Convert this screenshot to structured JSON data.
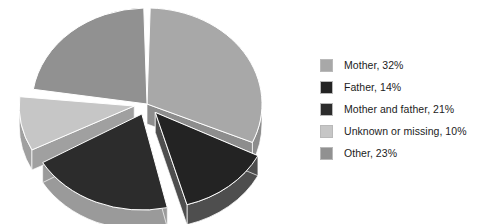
{
  "chart_data": {
    "type": "pie",
    "title": "",
    "subtitle": "",
    "xlabel": "",
    "ylabel": "",
    "style": "3d-exploded",
    "legend_position": "right",
    "grid": false,
    "categories": [
      "Mother",
      "Father",
      "Mother and father",
      "Unknown or missing",
      "Other"
    ],
    "values": [
      32,
      14,
      21,
      10,
      23
    ],
    "value_unit": "%",
    "slices": [
      {
        "label": "Mother",
        "value": 32,
        "legend_text": "Mother, 32%",
        "color": "#a8a8a8",
        "side_color": "#8d8d8d",
        "exploded": false
      },
      {
        "label": "Father",
        "value": 14,
        "legend_text": "Father, 14%",
        "color": "#232323",
        "side_color": "#4e4e4e",
        "exploded": true
      },
      {
        "label": "Mother and father",
        "value": 21,
        "legend_text": "Mother and father, 21%",
        "color": "#2c2c2c",
        "side_color": "#9a9a9a",
        "exploded": true
      },
      {
        "label": "Unknown or missing",
        "value": 10,
        "legend_text": "Unknown or missing, 10%",
        "color": "#c6c6c6",
        "side_color": "#a0a0a0",
        "exploded": true
      },
      {
        "label": "Other",
        "value": 23,
        "legend_text": "Other, 23%",
        "color": "#919191",
        "side_color": "#7d7d7d",
        "exploded": false
      }
    ]
  },
  "legend": {
    "items": [
      {
        "label": "Mother, 32%",
        "color": "#a8a8a8"
      },
      {
        "label": "Father, 14%",
        "color": "#232323"
      },
      {
        "label": "Mother and father, 21%",
        "color": "#2c2c2c"
      },
      {
        "label": "Unknown or missing, 10%",
        "color": "#c6c6c6"
      },
      {
        "label": "Other, 23%",
        "color": "#919191"
      }
    ]
  },
  "colors": {
    "background": "#ffffff",
    "text": "#1c1c1c",
    "swatch_border": "#b9b9b9"
  }
}
